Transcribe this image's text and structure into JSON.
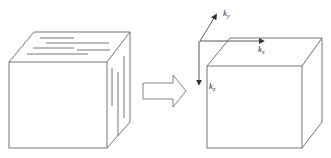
{
  "diagram": {
    "left_cube": {
      "label": "cube-with-layer-lines"
    },
    "arrow": {
      "label": "transform-arrow"
    },
    "right_cube": {
      "label": "cube-with-axes"
    },
    "axes": {
      "ky": {
        "base": "k",
        "sub": "y"
      },
      "kx": {
        "base": "k",
        "sub": "x"
      },
      "kz": {
        "base": "k",
        "sub": "z"
      }
    },
    "colors": {
      "stroke": "#555555",
      "background": "#ffffff"
    }
  }
}
